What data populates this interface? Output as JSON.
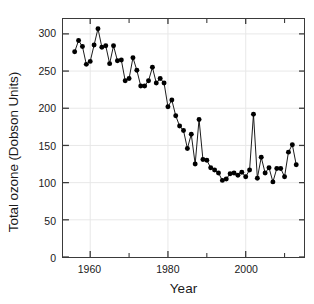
{
  "chart_data": {
    "type": "line",
    "title": "",
    "xlabel": "Year",
    "ylabel": "Total ozone (Dobson Units)",
    "xlim": [
      1953,
      2015
    ],
    "ylim": [
      0,
      320
    ],
    "grid": true,
    "legend": null,
    "marker": "filled-circle",
    "line_color": "#000000",
    "marker_color": "#000000",
    "y_ticks": [
      0,
      50,
      100,
      150,
      200,
      250,
      300
    ],
    "y_tick_labels": [
      "0",
      "50",
      "100",
      "150",
      "200",
      "250",
      "300"
    ],
    "x_ticks_major": [
      1960,
      1980,
      2000
    ],
    "x_tick_labels": [
      "1960",
      "1980",
      "2000"
    ],
    "x_ticks_minor": [
      1970,
      1990,
      2010
    ],
    "x": [
      1956,
      1957,
      1958,
      1959,
      1960,
      1961,
      1962,
      1963,
      1964,
      1965,
      1966,
      1967,
      1968,
      1969,
      1970,
      1971,
      1972,
      1973,
      1974,
      1975,
      1976,
      1977,
      1978,
      1979,
      1980,
      1981,
      1982,
      1983,
      1984,
      1985,
      1986,
      1987,
      1988,
      1989,
      1990,
      1991,
      1992,
      1993,
      1994,
      1995,
      1996,
      1997,
      1998,
      1999,
      2000,
      2001,
      2002,
      2003,
      2004,
      2005,
      2006,
      2007,
      2008,
      2009,
      2010,
      2011,
      2012,
      2013
    ],
    "y": [
      276,
      291,
      283,
      259,
      263,
      285,
      307,
      282,
      284,
      260,
      284,
      264,
      265,
      237,
      240,
      268,
      251,
      230,
      230,
      237,
      255,
      234,
      240,
      234,
      202,
      211,
      190,
      176,
      170,
      146,
      165,
      125,
      185,
      131,
      130,
      120,
      117,
      113,
      103,
      105,
      112,
      113,
      110,
      114,
      108,
      117,
      192,
      106,
      134,
      113,
      120,
      101,
      119,
      119,
      108,
      141,
      151,
      124
    ],
    "series_name": "October mean total ozone"
  },
  "axis": {
    "y_title": "Total ozone (Dobson Units)",
    "x_title": "Year"
  }
}
